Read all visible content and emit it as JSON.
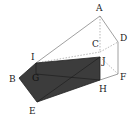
{
  "figure": {
    "type": "triangular prism with shaded cross-section",
    "labels": {
      "A": "A",
      "B": "B",
      "C": "C",
      "D": "D",
      "E": "E",
      "F": "F",
      "G": "G",
      "H": "H",
      "I": "I",
      "J": "J"
    },
    "colors": {
      "edge": "#888888",
      "section_fill": "#3c3c3c",
      "background": "#ffffff"
    }
  }
}
